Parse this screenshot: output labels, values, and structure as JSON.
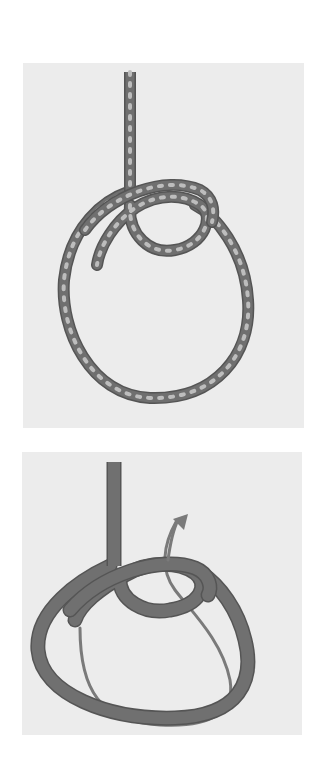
{
  "diagram": {
    "steps": [
      {
        "index": 1,
        "description": "rope with standing part forms a large loop and a small inner loop; rope shown dotted"
      },
      {
        "index": 2,
        "description": "same loop shape with arrow showing the working end path passing up through the small loop"
      }
    ],
    "colors": {
      "background": "#ffffff",
      "panel": "#ececec",
      "rope": "#6f6f6f",
      "rope_edge": "#555555",
      "rope_dots": "#bdbdbd",
      "path_line": "#7a7a7a"
    }
  }
}
